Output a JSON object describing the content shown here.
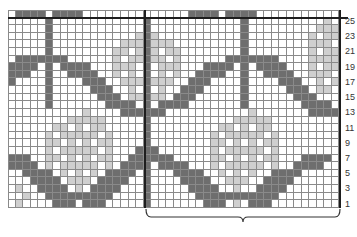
{
  "chart": {
    "type": "knitting-colorwork-chart",
    "columns": 44,
    "rows": 26,
    "legend_colors": {
      "D": "#6e6e6e",
      "L": "#cfcfcf",
      ".": "#ffffff"
    },
    "row_labels": [
      "25",
      "23",
      "21",
      "19",
      "17",
      "15",
      "13",
      "11",
      "9",
      "7",
      "5",
      "3",
      "1"
    ],
    "repeat_bracket": {
      "from_col": 18,
      "to_col": 44
    },
    "grid_rows_top_to_bottom": [
      ".DDDD.DDDD..............DDDD.DDDD..........",
      ".....D............D............D..........L.",
      ".....D............D............D.........LLL",
      ".....D...........LDL...........D........L.LL",
      ".....D.........LLLDLLL.........D........LLL.",
      ".....D........LL.LDL.LL........D........L.LL",
      ".DDDDDDD......L.LLDLL.L......DDDDDDD....LLLL",
      "DDDD.D.DDDD...LLL.D.LLL...DDDD.D.DDDD...L.LL",
      "DDD..D..DDDD..L.L.D.L.L..DDDD..D..DDDD..LLL.",
      "D....D....DDD..LLLDLLL..DDD....D....DDD..L.L",
      ".....D.....DDD..L.D.L..DDD.....D.....DDD.LL.",
      ".....D......DDD.LLDLL.DDD......D......DDD...",
      ".....D.......DDDD.D.DDDD.......D.......DDDD.",
      "..........L....DDDDDD...........L.......DDDD",
      "........LLLLL.....D...........LLLLL.........",
      "......LL.L.LL.....D.........LL.L.LL.........",
      ".....L.LLLLL.L....D........L.LLLLL.L........",
      ".....LL.L.L.LL....D........LL.L.L.LL........",
      ".....L.LLLLL.L...DDD.......L.LLLLL.L........",
      "DDD..LL.L.L.LL..DDDDDD.....LL.L.L.LL...DDDD.",
      "DDDD.L.LLLLL.L.DDDD.DDDD...L.LLLLL.L..DDDD..",
      "..DDDD.L.L.L.DDDD.D...DDDD..L.L.L..DDDD.....",
      "...DDDD.LLL.DDDD..D....DDDD..LLL..DDDD......",
      ".L..DDDD.L.DDDD...D.....DDDD..L..DDDD.......",
      "..L..DDDDDDDDD....D......DDDDDDDDDDD........",
      ".L....DDD.DDD.....D.......DDD.L.DDD.........."
    ]
  }
}
